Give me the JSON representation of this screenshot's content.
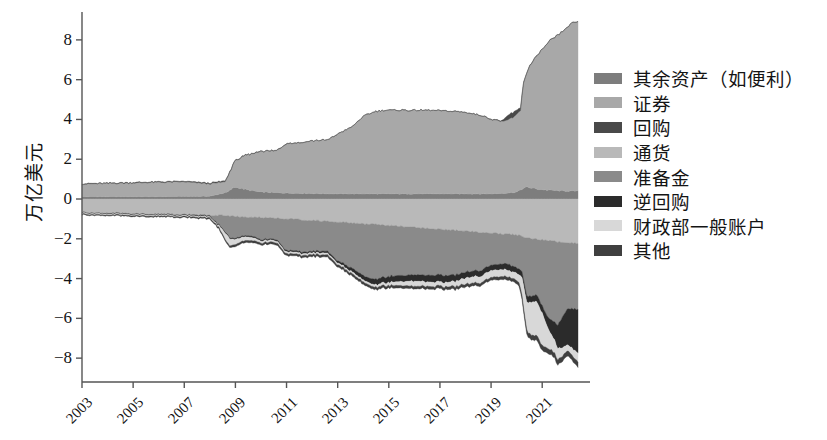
{
  "chart_data": {
    "type": "area",
    "stacked": true,
    "title": "",
    "xlabel": "",
    "ylabel": "万亿美元",
    "xlim": [
      2003,
      2022.4
    ],
    "ylim": [
      -9.2,
      9.0
    ],
    "yticks": [
      8,
      6,
      4,
      2,
      0,
      -2,
      -4,
      -6,
      -8
    ],
    "ytick_labels": [
      "8",
      "6",
      "4",
      "2",
      "0",
      "−2",
      "−4",
      "−6",
      "−8"
    ],
    "xticks": [
      2003,
      2005,
      2007,
      2009,
      2011,
      2013,
      2015,
      2017,
      2019,
      2021
    ],
    "xtick_labels": [
      "2003",
      "2005",
      "2007",
      "2009",
      "2011",
      "2013",
      "2015",
      "2017",
      "2019",
      "2021"
    ],
    "grid": false,
    "legend_position": "right",
    "series": [
      {
        "name": "其余资产（如便利）",
        "color": "#7d7d7d",
        "side": "positive",
        "x": [
          2003,
          2004,
          2005,
          2006,
          2007,
          2008.0,
          2008.7,
          2008.9,
          2009.0,
          2009.5,
          2010,
          2011,
          2012,
          2013,
          2014,
          2015,
          2016,
          2017,
          2018,
          2019,
          2019.6,
          2020.0,
          2020.2,
          2020.4,
          2020.8,
          2021.2,
          2021.6,
          2022.0,
          2022.4
        ],
        "values": [
          0.12,
          0.12,
          0.12,
          0.12,
          0.13,
          0.14,
          0.35,
          0.55,
          0.6,
          0.45,
          0.35,
          0.3,
          0.28,
          0.26,
          0.26,
          0.26,
          0.26,
          0.26,
          0.26,
          0.26,
          0.3,
          0.35,
          0.5,
          0.6,
          0.5,
          0.45,
          0.42,
          0.4,
          0.4
        ]
      },
      {
        "name": "证券",
        "color": "#a8a8a8",
        "side": "positive",
        "x": [
          2003,
          2004,
          2005,
          2006,
          2007,
          2008.0,
          2008.6,
          2008.8,
          2009.0,
          2009.4,
          2010,
          2010.6,
          2011,
          2011.6,
          2012,
          2012.6,
          2013,
          2013.6,
          2014,
          2014.5,
          2015,
          2016,
          2017,
          2018,
          2018.6,
          2019,
          2019.5,
          2019.9,
          2020.15,
          2020.25,
          2020.5,
          2020.9,
          2021.3,
          2021.8,
          2022.1,
          2022.4
        ],
        "values": [
          0.63,
          0.66,
          0.69,
          0.72,
          0.73,
          0.62,
          0.55,
          0.95,
          1.35,
          1.7,
          2.05,
          2.1,
          2.5,
          2.55,
          2.65,
          2.7,
          3.0,
          3.4,
          3.9,
          4.15,
          4.2,
          4.2,
          4.18,
          4.1,
          3.95,
          3.75,
          3.6,
          3.8,
          4.0,
          5.2,
          6.1,
          6.9,
          7.5,
          8.0,
          8.4,
          8.5
        ]
      },
      {
        "name": "回购",
        "color": "#494949",
        "side": "positive",
        "x": [
          2003,
          2007,
          2008.5,
          2009,
          2012,
          2015,
          2018,
          2019.4,
          2019.65,
          2019.9,
          2020.1,
          2020.3,
          2021,
          2022.4
        ],
        "values": [
          0.02,
          0.03,
          0.05,
          0.02,
          0.01,
          0.01,
          0.01,
          0.02,
          0.22,
          0.26,
          0.18,
          0.03,
          0.01,
          0.01
        ]
      },
      {
        "name": "通货",
        "color": "#b9b9b9",
        "side": "negative",
        "x": [
          2003,
          2005,
          2007,
          2008.5,
          2009,
          2010,
          2011,
          2012,
          2013,
          2014,
          2015,
          2016,
          2017,
          2018,
          2019,
          2020,
          2020.4,
          2021,
          2021.6,
          2022.4
        ],
        "values": [
          0.67,
          0.73,
          0.78,
          0.83,
          0.88,
          0.93,
          1.0,
          1.08,
          1.15,
          1.25,
          1.33,
          1.42,
          1.52,
          1.62,
          1.72,
          1.8,
          1.95,
          2.05,
          2.15,
          2.22
        ]
      },
      {
        "name": "准备金",
        "color": "#8a8a8a",
        "side": "negative",
        "x": [
          2003,
          2005,
          2007,
          2008.0,
          2008.6,
          2008.8,
          2009.0,
          2009.5,
          2010,
          2010.6,
          2011,
          2011.6,
          2012,
          2012.6,
          2013,
          2013.6,
          2014,
          2014.4,
          2015,
          2015.6,
          2016,
          2017,
          2017.6,
          2018,
          2018.6,
          2019,
          2019.5,
          2019.9,
          2020.2,
          2020.4,
          2020.8,
          2021.2,
          2021.6,
          2022.0,
          2022.4
        ],
        "values": [
          0.02,
          0.02,
          0.02,
          0.03,
          0.8,
          1.1,
          1.1,
          0.9,
          1.1,
          1.05,
          1.6,
          1.6,
          1.55,
          1.5,
          1.95,
          2.3,
          2.6,
          2.8,
          2.55,
          2.45,
          2.4,
          2.3,
          2.25,
          2.05,
          1.9,
          1.6,
          1.5,
          1.6,
          1.75,
          2.95,
          2.8,
          3.85,
          4.2,
          3.3,
          3.3
        ]
      },
      {
        "name": "逆回购",
        "color": "#2b2b2b",
        "side": "negative",
        "x": [
          2003,
          2007,
          2008.5,
          2009.5,
          2010.5,
          2011,
          2012,
          2013,
          2013.6,
          2014,
          2014.6,
          2015,
          2015.6,
          2016,
          2016.6,
          2017,
          2018,
          2019,
          2019.6,
          2020.1,
          2020.4,
          2021,
          2021.4,
          2021.8,
          2022.1,
          2022.4
        ],
        "values": [
          0.02,
          0.03,
          0.05,
          0.06,
          0.06,
          0.07,
          0.08,
          0.1,
          0.18,
          0.22,
          0.28,
          0.3,
          0.3,
          0.32,
          0.33,
          0.35,
          0.3,
          0.28,
          0.3,
          0.28,
          0.3,
          0.35,
          0.75,
          1.55,
          1.9,
          2.2
        ]
      },
      {
        "name": "财政部一般账户",
        "color": "#d8d8d8",
        "side": "negative",
        "x": [
          2003,
          2007,
          2008.3,
          2008.7,
          2009,
          2010,
          2011,
          2012,
          2013,
          2014,
          2015,
          2016,
          2017,
          2018,
          2019,
          2019.8,
          2020.1,
          2020.25,
          2020.5,
          2020.75,
          2021.0,
          2021.3,
          2021.6,
          2022.0,
          2022.4
        ],
        "values": [
          0.05,
          0.05,
          0.06,
          0.4,
          0.25,
          0.1,
          0.09,
          0.09,
          0.09,
          0.1,
          0.15,
          0.25,
          0.2,
          0.3,
          0.35,
          0.33,
          0.38,
          1.1,
          1.6,
          1.7,
          1.6,
          0.85,
          0.55,
          0.3,
          0.45
        ]
      },
      {
        "name": "其他",
        "color": "#3f3f3f",
        "side": "negative",
        "x": [
          2003,
          2007,
          2008.5,
          2009,
          2010,
          2012,
          2014,
          2016,
          2018,
          2019,
          2020,
          2020.4,
          2021,
          2021.6,
          2022.4
        ],
        "values": [
          0.04,
          0.05,
          0.07,
          0.1,
          0.1,
          0.1,
          0.12,
          0.13,
          0.14,
          0.14,
          0.16,
          0.22,
          0.25,
          0.25,
          0.26
        ]
      }
    ]
  },
  "legend": {
    "items": [
      {
        "label": "其余资产（如便利）",
        "color": "#7d7d7d"
      },
      {
        "label": "证券",
        "color": "#a8a8a8"
      },
      {
        "label": "回购",
        "color": "#494949"
      },
      {
        "label": "通货",
        "color": "#b9b9b9"
      },
      {
        "label": "准备金",
        "color": "#8a8a8a"
      },
      {
        "label": "逆回购",
        "color": "#2b2b2b"
      },
      {
        "label": "财政部一般账户",
        "color": "#d8d8d8"
      },
      {
        "label": "其他",
        "color": "#3f3f3f"
      }
    ]
  },
  "axes": {
    "y_axis_label": "万亿美元",
    "axis_color": "#555555"
  }
}
